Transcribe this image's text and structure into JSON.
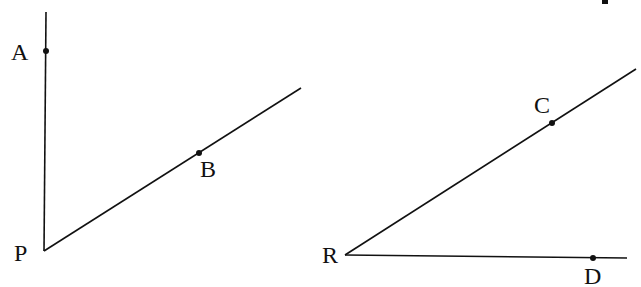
{
  "figures": [
    {
      "name": "angle-APB",
      "vertex": {
        "label": "P",
        "x": 44,
        "y": 251
      },
      "rays": [
        {
          "end": {
            "x": 46,
            "y": 12
          },
          "point": {
            "label": "A",
            "x": 46,
            "y": 51
          }
        },
        {
          "end": {
            "x": 301,
            "y": 88
          },
          "point": {
            "label": "B",
            "x": 199,
            "y": 153
          }
        }
      ]
    },
    {
      "name": "angle-CRD",
      "vertex": {
        "label": "R",
        "x": 345,
        "y": 255
      },
      "rays": [
        {
          "end": {
            "x": 636,
            "y": 69
          },
          "point": {
            "label": "C",
            "x": 552,
            "y": 123
          }
        },
        {
          "end": {
            "x": 627,
            "y": 258
          },
          "point": {
            "label": "D",
            "x": 593,
            "y": 258
          }
        }
      ]
    }
  ],
  "labels": {
    "A": "A",
    "B": "B",
    "P": "P",
    "C": "C",
    "R": "R",
    "D": "D"
  },
  "colors": {
    "stroke": "#111111",
    "background": "#ffffff"
  }
}
